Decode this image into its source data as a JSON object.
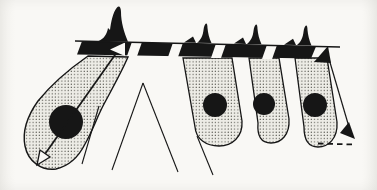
{
  "figure": {
    "kind": "geological cross-section diagram: volcanoes at surface fed by stippled dikes and plutons with black magma bodies, motion arrows",
    "canvas": {
      "width": 377,
      "height": 190
    }
  },
  "colors": {
    "ink": "#161616",
    "paper": "#f9f8f5",
    "stipple_bg": "#edece6",
    "stipple_dot": "#26261f",
    "none": "none"
  },
  "shapes": [
    {
      "name": "pluton-left-body",
      "type": "path",
      "d": "M88,56 L128,57 C121,73 112,89 104,104 C97,117 93,130 85,144 C79,156 69,166 56,169 C41,171 28,161 25,146 C22,131 28,115 38,101 C50,86 68,70 88,56 Z",
      "fill": "stipple",
      "stroke": "ink",
      "sw": 1.4
    },
    {
      "name": "magma-body-left",
      "type": "circle",
      "cx": 66,
      "cy": 122,
      "r": 17,
      "fill": "ink"
    },
    {
      "name": "pluton-tube-1",
      "type": "path",
      "d": "M183,58 L232,58 L242,121 C243,137 232,146 219,146 C206,146 196,139 195,127 Z",
      "fill": "stipple",
      "stroke": "ink",
      "sw": 1.3
    },
    {
      "name": "pluton-tube-2",
      "type": "path",
      "d": "M249,58 L279,58 L289,119 C290,135 281,143 271,143 C261,143 257,136 258,123 Z",
      "fill": "stipple",
      "stroke": "ink",
      "sw": 1.3
    },
    {
      "name": "pluton-tube-3",
      "type": "path",
      "d": "M295,58 L327,58 L337,122 C338,139 328,147 318,147 C308,147 304,140 304,127 Z",
      "fill": "stipple",
      "stroke": "ink",
      "sw": 1.3
    },
    {
      "name": "magma-body-1",
      "type": "circle",
      "cx": 215,
      "cy": 105,
      "r": 12,
      "fill": "ink"
    },
    {
      "name": "magma-body-2",
      "type": "circle",
      "cx": 264,
      "cy": 104,
      "r": 11,
      "fill": "ink"
    },
    {
      "name": "magma-body-3",
      "type": "circle",
      "cx": 315,
      "cy": 105,
      "r": 12,
      "fill": "ink"
    },
    {
      "name": "fault-line-below-left-pluton",
      "type": "line",
      "x1": 99,
      "y1": 106,
      "x2": 82,
      "y2": 164,
      "stroke": "ink",
      "sw": 1.1
    },
    {
      "name": "chevron-left-leg",
      "type": "line",
      "x1": 143,
      "y1": 83,
      "x2": 112,
      "y2": 170,
      "stroke": "ink",
      "sw": 1.1
    },
    {
      "name": "chevron-right-leg",
      "type": "line",
      "x1": 143,
      "y1": 83,
      "x2": 178,
      "y2": 172,
      "stroke": "ink",
      "sw": 1.1
    },
    {
      "name": "fault-line-below-tube-1",
      "type": "line",
      "x1": 197,
      "y1": 136,
      "x2": 213,
      "y2": 175,
      "stroke": "ink",
      "sw": 1.1
    },
    {
      "name": "sill-band",
      "type": "path",
      "d": "M82,41.2 L316,46.6 L311,58.6 L77,54.6 Z",
      "fill": "ink"
    },
    {
      "name": "sill-gap-1",
      "type": "polygon",
      "points": "132,41.7 142,41.9 137,56.2 127,56.0",
      "fill": "paper"
    },
    {
      "name": "sill-gap-2",
      "type": "polygon",
      "points": "173,42.6 183,42.8 178,57.1 168,56.9",
      "fill": "paper"
    },
    {
      "name": "sill-gap-3",
      "type": "polygon",
      "points": "216,43.6 226,43.8 221,58.1 211,57.9",
      "fill": "paper"
    },
    {
      "name": "sill-gap-4",
      "type": "polygon",
      "points": "267,44.7 277,44.9 272,59.2 262,59.0",
      "fill": "paper"
    },
    {
      "name": "ascent-arrow-shaft",
      "type": "line",
      "x1": 122,
      "y1": 45,
      "x2": 45,
      "y2": 154,
      "stroke": "ink",
      "sw": 1.7
    },
    {
      "name": "slip-indicator-white-triangle",
      "type": "polygon",
      "points": "110,49.5 125,42.5 125,56",
      "fill": "paper"
    },
    {
      "name": "ascent-arrow-open-head",
      "type": "polygon",
      "points": "37,165 50,157 40,150",
      "fill": "paper",
      "stroke": "ink",
      "sw": 1.3
    },
    {
      "name": "volcano-1",
      "type": "path",
      "d": "M98,41.2 C104,39 107,34 108,28 L110,30 C111,22 113,12 117,7.5 C119,5.2 121,7 121,12 C121,22 124,32 128,41.8 Z",
      "fill": "ink"
    },
    {
      "name": "volcano-2-foothill",
      "type": "polygon",
      "points": "184,42.5 193,36.5 196,42.8",
      "fill": "ink"
    },
    {
      "name": "volcano-2",
      "type": "path",
      "d": "M197,42.8 C201,40 203,35 203.5,30 C204,26 205,24 206,23.5 C207,23.2 207.5,25 207.5,28 C208,33 209,38 211.5,43.1 Z",
      "fill": "ink"
    },
    {
      "name": "volcano-3-foothill",
      "type": "polygon",
      "points": "234,43.6 243,37.6 246,43.9",
      "fill": "ink"
    },
    {
      "name": "volcano-3",
      "type": "path",
      "d": "M247,43.9 C251,41 253,36 253.5,31 C254,27 255,25 256,24.5 C257,24.2 257.5,26 257.5,29 C258,34 259,39 261.5,44.2 Z",
      "fill": "ink"
    },
    {
      "name": "volcano-4-foothill",
      "type": "polygon",
      "points": "284,44.7 293,38.7 296,45.0",
      "fill": "ink"
    },
    {
      "name": "volcano-4",
      "type": "path",
      "d": "M297,45.0 C301,42 303,37 303.5,32 C304,28 305,26 306,25.5 C307,25.2 307.5,27 307.5,30 C308,35 309,40 311.5,45.4 Z",
      "fill": "ink"
    },
    {
      "name": "surface-line",
      "type": "line",
      "x1": 75,
      "y1": 41,
      "x2": 340,
      "y2": 47,
      "stroke": "ink",
      "sw": 1.5
    },
    {
      "name": "motion-arrow-shaft",
      "type": "line",
      "x1": 329,
      "y1": 59,
      "x2": 349,
      "y2": 127,
      "stroke": "ink",
      "sw": 1.2
    },
    {
      "name": "motion-arrow-head-up",
      "type": "polygon",
      "points": "328,46 314,62 331,63",
      "fill": "ink"
    },
    {
      "name": "motion-arrow-head-down",
      "type": "polygon",
      "points": "355,139 340,133 349,122",
      "fill": "ink"
    },
    {
      "name": "depth-reference-dashes",
      "type": "line",
      "x1": 318,
      "y1": 143.5,
      "x2": 354,
      "y2": 144.5,
      "stroke": "ink",
      "sw": 1.8,
      "dash": "5.5,4"
    }
  ]
}
